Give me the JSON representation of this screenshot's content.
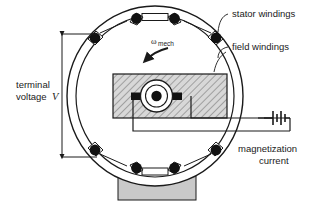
{
  "figure": {
    "name": "synchronous-generator-cross-section",
    "background_color": "#ffffff",
    "line_color": "#1a1a1a",
    "fill_gray": "#c9c9c9",
    "hatch_color": "#555555"
  },
  "labels": {
    "stator_windings": "stator windings",
    "field_windings": "field windings",
    "magnetization_current_line1": "magnetization",
    "magnetization_current_line2": "current",
    "terminal_voltage_line1": "terminal",
    "terminal_voltage_line2": "voltage",
    "terminal_voltage_symbol": "V",
    "omega_symbol": "ω",
    "omega_subscript": "mech"
  },
  "components": {
    "stator_ring_outer_label": "stator-outer-ring",
    "stator_ring_inner_label": "stator-inner-ring",
    "rotor_label": "rotor-core",
    "shaft_label": "rotor-shaft",
    "brush_label": "brush-contact",
    "base_label": "machine-base",
    "battery_label": "dc-source-battery",
    "winding_slot_count": 8,
    "coil_box_count": 4
  },
  "geometry": {
    "ring_center_x": 155,
    "ring_center_y": 96,
    "ring_outer_rx": 88,
    "ring_outer_ry": 90,
    "ring_inner_rx": 79,
    "ring_inner_ry": 81,
    "dimension_line_x": 62,
    "dimension_top_y": 34,
    "dimension_bottom_y": 157
  }
}
